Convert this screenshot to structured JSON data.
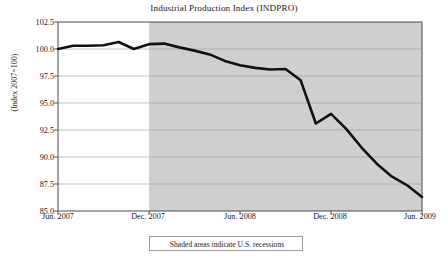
{
  "chart_data": {
    "type": "line",
    "title": "Industrial Production Index (INDPRO)",
    "xlabel": "",
    "ylabel": "(Index 2007=100)",
    "ylim": [
      85.0,
      102.5
    ],
    "yticks": [
      102.5,
      100.0,
      97.5,
      95.0,
      92.5,
      90.0,
      87.5,
      85.0
    ],
    "ytick_labels": [
      "102.5",
      "100.0",
      "97.5",
      "95.0",
      "92.5",
      "90.0",
      "87.5",
      "85.0"
    ],
    "xticks": [
      "Jun. 2007",
      "Dec. 2007",
      "Jun. 2008",
      "Dec. 2008",
      "Jun. 2009"
    ],
    "xlim": [
      "Jun. 2007",
      "Jun. 2009"
    ],
    "grid": "horizontal",
    "legend": "none",
    "line_color": "#111111",
    "line_width": 2.6,
    "shading": {
      "label": "Shaded areas indicate U.S. recessions",
      "color": "#cfcfcf",
      "start": "Dec. 2007",
      "end": "Jun. 2009"
    },
    "x": [
      "Jun. 2007",
      "Jul. 2007",
      "Aug. 2007",
      "Sep. 2007",
      "Oct. 2007",
      "Nov. 2007",
      "Dec. 2007",
      "Jan. 2008",
      "Feb. 2008",
      "Mar. 2008",
      "Apr. 2008",
      "May. 2008",
      "Jun. 2008",
      "Jul. 2008",
      "Aug. 2008",
      "Sep. 2008",
      "Oct. 2008",
      "Nov. 2008",
      "Dec. 2008",
      "Jan. 2009",
      "Feb. 2009",
      "Mar. 2009",
      "Apr. 2009",
      "May. 2009",
      "Jun. 2009"
    ],
    "values": [
      100.0,
      100.3,
      100.3,
      100.35,
      100.65,
      100.0,
      100.45,
      100.5,
      100.15,
      99.85,
      99.5,
      98.9,
      98.5,
      98.25,
      98.1,
      98.15,
      97.1,
      93.1,
      94.0,
      92.6,
      90.9,
      89.4,
      88.2,
      87.4,
      86.3
    ],
    "annotations": []
  },
  "footnote": {
    "text": "Shaded areas indicate U.S. recessions"
  }
}
